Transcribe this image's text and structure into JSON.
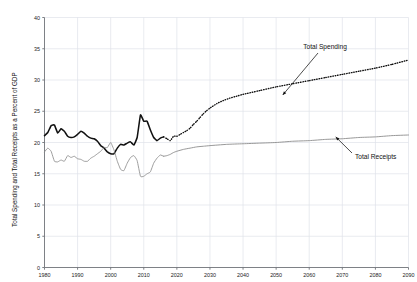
{
  "chart_data": {
    "type": "line",
    "title": "",
    "xlabel": "",
    "ylabel": "Total Spending and Total Receipts as a Percent of GDP",
    "xlim": [
      1980,
      2090
    ],
    "ylim": [
      0,
      40
    ],
    "xticks": [
      1980,
      1990,
      2000,
      2010,
      2020,
      2030,
      2040,
      2050,
      2060,
      2070,
      2080,
      2090
    ],
    "yticks": [
      0,
      5,
      10,
      15,
      20,
      25,
      30,
      35,
      40
    ],
    "grid": true,
    "legend_position": "inline-annotations",
    "annotations": [
      {
        "text": "Total Spending",
        "target_x": 2052,
        "target_y": 27.6
      },
      {
        "text": "Total Receipts",
        "target_x": 2068,
        "target_y": 20.9
      }
    ],
    "series": [
      {
        "name": "Total Spending",
        "style": "solid-thick-black",
        "color": "#111111",
        "projection_style": "dotted",
        "projection_start_x": 2016,
        "x": [
          1980,
          1981,
          1982,
          1983,
          1984,
          1985,
          1986,
          1987,
          1988,
          1989,
          1990,
          1991,
          1992,
          1993,
          1994,
          1995,
          1996,
          1997,
          1998,
          1999,
          2000,
          2001,
          2002,
          2003,
          2004,
          2005,
          2006,
          2007,
          2008,
          2009,
          2010,
          2011,
          2012,
          2013,
          2014,
          2015,
          2016,
          2017,
          2018,
          2019,
          2020,
          2021,
          2022,
          2023,
          2024,
          2025,
          2026,
          2027,
          2028,
          2029,
          2030,
          2032,
          2034,
          2036,
          2038,
          2040,
          2045,
          2050,
          2055,
          2060,
          2065,
          2070,
          2075,
          2080,
          2085,
          2090
        ],
        "y": [
          21.1,
          21.6,
          22.7,
          22.8,
          21.5,
          22.2,
          21.8,
          21.0,
          20.8,
          20.9,
          21.3,
          21.8,
          21.5,
          21.0,
          20.7,
          20.6,
          20.2,
          19.5,
          19.1,
          18.5,
          18.2,
          18.2,
          19.1,
          19.7,
          19.6,
          19.9,
          20.1,
          19.6,
          20.8,
          24.4,
          23.4,
          23.4,
          22.0,
          20.8,
          20.3,
          20.7,
          20.9,
          20.6,
          20.3,
          21.0,
          21.0,
          21.3,
          21.6,
          21.9,
          22.3,
          22.9,
          23.4,
          24.0,
          24.6,
          25.1,
          25.5,
          26.2,
          26.7,
          27.1,
          27.4,
          27.7,
          28.3,
          28.9,
          29.4,
          29.9,
          30.4,
          30.9,
          31.4,
          31.9,
          32.5,
          33.2
        ]
      },
      {
        "name": "Total Receipts",
        "style": "solid-thin-gray",
        "color": "#8c8c8c",
        "projection_style": "solid",
        "projection_start_x": 2016,
        "x": [
          1980,
          1981,
          1982,
          1983,
          1984,
          1985,
          1986,
          1987,
          1988,
          1989,
          1990,
          1991,
          1992,
          1993,
          1994,
          1995,
          1996,
          1997,
          1998,
          1999,
          2000,
          2001,
          2002,
          2003,
          2004,
          2005,
          2006,
          2007,
          2008,
          2009,
          2010,
          2011,
          2012,
          2013,
          2014,
          2015,
          2016,
          2017,
          2018,
          2019,
          2020,
          2022,
          2024,
          2026,
          2028,
          2030,
          2035,
          2040,
          2045,
          2050,
          2055,
          2060,
          2065,
          2070,
          2075,
          2080,
          2085,
          2090
        ],
        "y": [
          18.5,
          19.1,
          18.6,
          17.0,
          16.9,
          17.2,
          17.0,
          17.9,
          17.6,
          17.8,
          17.4,
          17.3,
          17.0,
          17.0,
          17.5,
          17.8,
          18.2,
          18.6,
          19.2,
          19.2,
          20.0,
          18.8,
          17.0,
          15.7,
          15.5,
          16.7,
          17.6,
          17.9,
          17.1,
          14.6,
          14.6,
          15.0,
          15.3,
          16.7,
          17.5,
          18.0,
          17.8,
          17.9,
          18.1,
          18.4,
          18.6,
          18.9,
          19.1,
          19.3,
          19.4,
          19.5,
          19.7,
          19.8,
          19.9,
          20.0,
          20.2,
          20.3,
          20.5,
          20.6,
          20.8,
          20.9,
          21.1,
          21.2
        ]
      }
    ]
  },
  "plot": {
    "grid_color": "#dfe3ea",
    "axis_color": "#6f7378",
    "background": "#ffffff"
  }
}
